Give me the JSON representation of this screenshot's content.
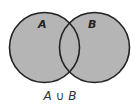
{
  "diagram": {
    "type": "venn",
    "sets": [
      {
        "label": "A",
        "cx": 44.5,
        "cy": 47.5,
        "r": 35
      },
      {
        "label": "B",
        "cx": 94.5,
        "cy": 47.5,
        "r": 35
      }
    ],
    "shaded_region": "union",
    "caption": "A ∪ B",
    "colors": {
      "fill": "#b5b5b5",
      "stroke": "#222222",
      "background": "#ffffff"
    }
  }
}
